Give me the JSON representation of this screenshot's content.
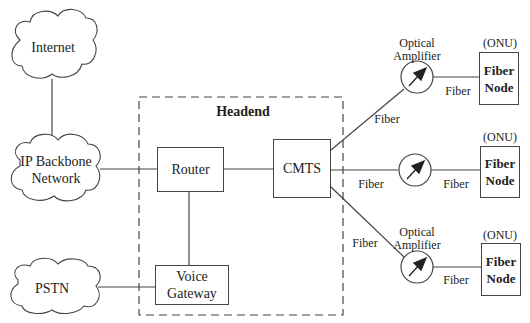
{
  "diagram": {
    "type": "network-topology",
    "title": "Headend",
    "clouds": [
      {
        "id": "internet",
        "label": "Internet"
      },
      {
        "id": "ip-backbone",
        "label_line1": "IP Backbone",
        "label_line2": "Network"
      },
      {
        "id": "pstn",
        "label": "PSTN"
      }
    ],
    "headend": {
      "label": "Headend",
      "router": "Router",
      "cmts": "CMTS",
      "voice_gateway_line1": "Voice",
      "voice_gateway_line2": "Gateway"
    },
    "branches": [
      {
        "amp_label_line1": "Optical",
        "amp_label_line2": "Amplifier",
        "fiber_in": "Fiber",
        "fiber_out": "Fiber",
        "onu": "(ONU)",
        "node_line1": "Fiber",
        "node_line2": "Node"
      },
      {
        "amp_label_line1": "",
        "amp_label_line2": "",
        "fiber_in": "Fiber",
        "fiber_out": "Fiber",
        "onu": "(ONU)",
        "node_line1": "Fiber",
        "node_line2": "Node"
      },
      {
        "amp_label_line1": "Optical",
        "amp_label_line2": "Amplifier",
        "fiber_in": "Fiber",
        "fiber_out": "Fiber",
        "onu": "(ONU)",
        "node_line1": "Fiber",
        "node_line2": "Node"
      }
    ],
    "edges": [
      [
        "Internet",
        "IP Backbone Network"
      ],
      [
        "IP Backbone Network",
        "Router"
      ],
      [
        "Router",
        "CMTS"
      ],
      [
        "Router",
        "Voice Gateway"
      ],
      [
        "PSTN",
        "Voice Gateway"
      ],
      [
        "CMTS",
        "Optical Amplifier (top)"
      ],
      [
        "CMTS",
        "Amplifier (middle)"
      ],
      [
        "CMTS",
        "Optical Amplifier (bottom)"
      ],
      [
        "Amplifiers",
        "Fiber Nodes (ONU)"
      ]
    ]
  }
}
